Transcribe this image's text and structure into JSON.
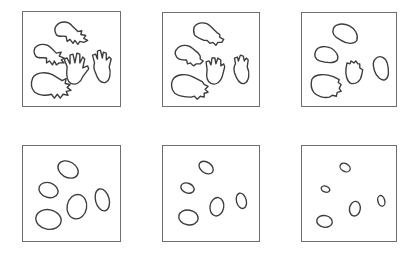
{
  "figure": {
    "stroke_color": "#3c3c3c",
    "border_color": "#6e6e6e",
    "panels": [
      {
        "id": "panel-1",
        "stage": "hands",
        "shape_count": 5
      },
      {
        "id": "panel-2",
        "stage": "rounded hands",
        "shape_count": 5
      },
      {
        "id": "panel-3",
        "stage": "blobs",
        "shape_count": 5
      },
      {
        "id": "panel-4",
        "stage": "large ellipses",
        "shape_count": 5
      },
      {
        "id": "panel-5",
        "stage": "medium ellipses",
        "shape_count": 5
      },
      {
        "id": "panel-6",
        "stage": "small ellipses",
        "shape_count": 5
      }
    ]
  }
}
